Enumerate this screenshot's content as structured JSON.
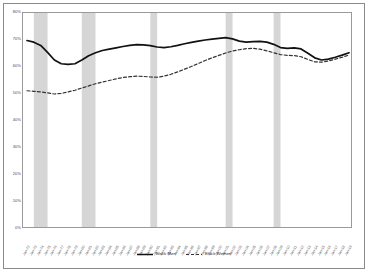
{
  "chart_data": {
    "type": "line",
    "title": "",
    "xlabel": "",
    "ylabel": "",
    "ylim": [
      0,
      80
    ],
    "ytick_labels": [
      "0%",
      "10%",
      "20%",
      "30%",
      "40%",
      "50%",
      "60%",
      "70%",
      "80%"
    ],
    "ytick_values": [
      0,
      10,
      20,
      30,
      40,
      50,
      60,
      70,
      80
    ],
    "grid": false,
    "legend_position": "bottom",
    "x": [
      "Jan-72",
      "Jan-73",
      "Jan-74",
      "Jan-75",
      "Jan-76",
      "Jan-77",
      "Jan-78",
      "Jan-79",
      "Jan-80",
      "Jan-81",
      "Jan-82",
      "Jan-83",
      "Jan-84",
      "Jan-85",
      "Jan-86",
      "Jan-87",
      "Jan-88",
      "Jan-89",
      "Jan-90",
      "Jan-91",
      "Jan-92",
      "Jan-93",
      "Jan-94",
      "Jan-95",
      "Jan-96",
      "Jan-97",
      "Jan-98",
      "Jan-99",
      "Jan-00",
      "Jan-01",
      "Jan-02",
      "Jan-03",
      "Jan-04",
      "Jan-05",
      "Jan-06",
      "Jan-07",
      "Jan-08",
      "Jan-09",
      "Jan-10",
      "Jan-11",
      "Jan-12",
      "Jan-13",
      "Jan-14",
      "Jan-15",
      "Jan-16",
      "Jan-17",
      "Jan-18",
      "Jan-19"
    ],
    "series": [
      {
        "name": "Black Men",
        "style": "solid",
        "color": "#111111",
        "values": [
          69.8,
          69.2,
          68.0,
          65.4,
          62.6,
          61.2,
          61.0,
          61.2,
          62.6,
          64.2,
          65.3,
          66.1,
          66.6,
          67.1,
          67.6,
          68.0,
          68.3,
          68.2,
          67.9,
          67.4,
          67.2,
          67.5,
          68.0,
          68.6,
          69.1,
          69.6,
          70.0,
          70.3,
          70.6,
          70.9,
          70.4,
          69.6,
          69.2,
          69.4,
          69.5,
          69.2,
          68.4,
          67.2,
          66.9,
          67.1,
          66.7,
          65.1,
          63.4,
          62.6,
          62.9,
          63.6,
          64.4,
          65.3
        ]
      },
      {
        "name": "Black Women",
        "style": "dashed",
        "color": "#333333",
        "values": [
          51.2,
          51.0,
          50.8,
          50.4,
          50.0,
          50.2,
          50.8,
          51.4,
          52.2,
          53.0,
          53.8,
          54.4,
          55.0,
          55.6,
          56.1,
          56.4,
          56.6,
          56.5,
          56.3,
          56.2,
          56.6,
          57.3,
          58.2,
          59.2,
          60.2,
          61.3,
          62.4,
          63.4,
          64.3,
          65.2,
          65.9,
          66.4,
          66.8,
          66.9,
          66.6,
          66.0,
          65.3,
          64.6,
          64.3,
          64.2,
          63.8,
          62.8,
          61.9,
          61.8,
          62.2,
          62.9,
          63.6,
          64.4
        ]
      }
    ],
    "recession_bands": [
      {
        "start": "Jan-73",
        "end": "Jan-75"
      },
      {
        "start": "Jan-80",
        "end": "Jan-82"
      },
      {
        "start": "Jan-90",
        "end": "Jan-91"
      },
      {
        "start": "Jan-01",
        "end": "Jan-02"
      },
      {
        "start": "Jan-08",
        "end": "Jan-09"
      }
    ],
    "band_color": "#d6d6d6"
  },
  "legend": {
    "items": [
      {
        "label": "Black Men"
      },
      {
        "label": "Black Women"
      }
    ]
  }
}
